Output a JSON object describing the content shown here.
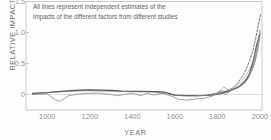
{
  "figure": {
    "annotation": "All lines represent independent estimates of the\nimpacts of the different factors from different studies",
    "axis_line_color": "#b9bdbf",
    "text_color": "#6a7073"
  },
  "chart_data": {
    "type": "line",
    "title": "",
    "xlabel": "YEAR",
    "ylabel": "RELATIVE IMPACT",
    "xlim": [
      900,
      2010
    ],
    "ylim": [
      -0.25,
      1.5
    ],
    "grid": false,
    "legend": null,
    "xticks": [
      1000,
      1200,
      1400,
      1600,
      1800,
      2000
    ],
    "xticklabels": [
      "1000",
      "1200",
      "1400",
      "1600",
      "1800",
      "2000"
    ],
    "yticks": [
      0,
      0.5,
      1.0,
      1.5
    ],
    "yticklabels": [
      "0",
      "0.5",
      "1.0",
      "1.5"
    ],
    "zero_line": 0,
    "series": [
      {
        "name": "estimate-1",
        "style": "solid-thick",
        "color": "#4a4f52",
        "x": [
          930,
          1000,
          1050,
          1100,
          1150,
          1200,
          1250,
          1300,
          1350,
          1400,
          1450,
          1500,
          1550,
          1600,
          1650,
          1700,
          1750,
          1800,
          1850,
          1900,
          1930,
          1950,
          1970,
          1985,
          2000
        ],
        "values": [
          0.02,
          0.03,
          0.045,
          0.06,
          0.07,
          0.075,
          0.07,
          0.065,
          0.055,
          0.05,
          0.05,
          0.045,
          0.04,
          -0.01,
          -0.02,
          -0.02,
          -0.015,
          0.0,
          0.05,
          0.12,
          0.2,
          0.32,
          0.55,
          0.8,
          0.97
        ]
      },
      {
        "name": "estimate-2",
        "style": "solid-thin",
        "color": "#6f7477",
        "x": [
          930,
          1000,
          1040,
          1060,
          1100,
          1150,
          1200,
          1250,
          1300,
          1330,
          1360,
          1400,
          1440,
          1470,
          1500,
          1540,
          1580,
          1620,
          1660,
          1700,
          1740,
          1780,
          1810,
          1840,
          1870,
          1900,
          1930,
          1955,
          1975,
          1990,
          2000
        ],
        "values": [
          0.0,
          0.01,
          -0.09,
          -0.11,
          -0.02,
          0.01,
          0.02,
          0.02,
          0.0,
          -0.02,
          0.0,
          0.02,
          -0.02,
          0.02,
          -0.01,
          0.02,
          -0.02,
          -0.08,
          -0.09,
          -0.07,
          -0.06,
          -0.02,
          0.05,
          0.0,
          0.08,
          0.13,
          0.23,
          0.36,
          0.5,
          0.72,
          0.93
        ]
      },
      {
        "name": "estimate-3",
        "style": "solid-thin",
        "color": "#7b8083",
        "x": [
          930,
          1020,
          1100,
          1200,
          1300,
          1400,
          1500,
          1560,
          1600,
          1660,
          1700,
          1760,
          1800,
          1830,
          1860,
          1890,
          1920,
          1945,
          1965,
          1980,
          1995,
          2002
        ],
        "values": [
          0.01,
          0.035,
          0.05,
          0.06,
          0.05,
          0.045,
          0.04,
          0.01,
          -0.015,
          -0.02,
          -0.02,
          -0.01,
          0.02,
          0.12,
          0.06,
          0.1,
          0.16,
          0.26,
          0.4,
          0.58,
          0.85,
          1.02
        ]
      },
      {
        "name": "estimate-4",
        "style": "solid-thin",
        "color": "#868b8e",
        "x": [
          1700,
          1750,
          1790,
          1820,
          1850,
          1880,
          1905,
          1930,
          1950,
          1965,
          1978,
          1990,
          2000
        ],
        "values": [
          -0.02,
          -0.01,
          0.01,
          0.06,
          0.04,
          0.09,
          0.14,
          0.22,
          0.32,
          0.45,
          0.6,
          0.82,
          1.05
        ]
      },
      {
        "name": "estimate-5",
        "style": "dashed",
        "color": "#5a5f62",
        "x": [
          1760,
          1800,
          1840,
          1870,
          1895,
          1915,
          1935,
          1952,
          1968,
          1980,
          1990,
          1998,
          2004
        ],
        "values": [
          -0.01,
          0.02,
          0.05,
          0.1,
          0.18,
          0.28,
          0.4,
          0.55,
          0.72,
          0.9,
          1.07,
          1.2,
          1.3
        ]
      },
      {
        "name": "estimate-6",
        "style": "solid-thin",
        "color": "#9a9fa2",
        "x": [
          1780,
          1820,
          1860,
          1890,
          1915,
          1940,
          1960,
          1975,
          1988,
          1998
        ],
        "values": [
          0.0,
          0.04,
          0.08,
          0.14,
          0.22,
          0.34,
          0.47,
          0.62,
          0.78,
          0.92
        ]
      }
    ]
  }
}
